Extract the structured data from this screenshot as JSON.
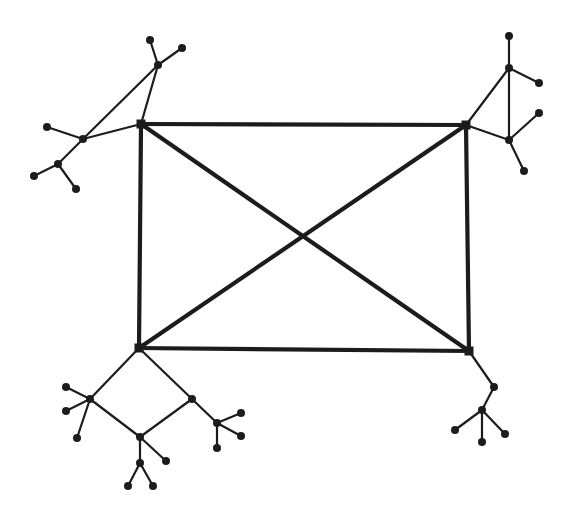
{
  "diagram": {
    "type": "graph",
    "colors": {
      "stroke": "#1c1c1c",
      "background": "#ffffff"
    },
    "core_nodes": [
      {
        "id": "TL",
        "x": 141,
        "y": 124
      },
      {
        "id": "TR",
        "x": 466,
        "y": 125
      },
      {
        "id": "BL",
        "x": 139,
        "y": 348
      },
      {
        "id": "BR",
        "x": 469,
        "y": 351
      }
    ],
    "core_edges": [
      [
        "TL",
        "TR"
      ],
      [
        "TR",
        "BR"
      ],
      [
        "BR",
        "BL"
      ],
      [
        "BL",
        "TL"
      ],
      [
        "TL",
        "BR"
      ],
      [
        "TR",
        "BL"
      ]
    ],
    "nodes": [
      {
        "id": "a1",
        "x": 150,
        "y": 40
      },
      {
        "id": "a2",
        "x": 182,
        "y": 48
      },
      {
        "id": "a3",
        "x": 158,
        "y": 65
      },
      {
        "id": "a4",
        "x": 83,
        "y": 139
      },
      {
        "id": "a5",
        "x": 47,
        "y": 127
      },
      {
        "id": "a6",
        "x": 58,
        "y": 164
      },
      {
        "id": "a7",
        "x": 34,
        "y": 176
      },
      {
        "id": "a8",
        "x": 76,
        "y": 189
      },
      {
        "id": "b1",
        "x": 509,
        "y": 36
      },
      {
        "id": "b2",
        "x": 509,
        "y": 68
      },
      {
        "id": "b3",
        "x": 539,
        "y": 83
      },
      {
        "id": "b4",
        "x": 509,
        "y": 140
      },
      {
        "id": "b5",
        "x": 539,
        "y": 113
      },
      {
        "id": "b6",
        "x": 524,
        "y": 171
      },
      {
        "id": "c1",
        "x": 90,
        "y": 399
      },
      {
        "id": "c2",
        "x": 66,
        "y": 387
      },
      {
        "id": "c3",
        "x": 66,
        "y": 411
      },
      {
        "id": "c4",
        "x": 77,
        "y": 438
      },
      {
        "id": "c5",
        "x": 192,
        "y": 399
      },
      {
        "id": "c6",
        "x": 140,
        "y": 437
      },
      {
        "id": "c7",
        "x": 217,
        "y": 423
      },
      {
        "id": "c8",
        "x": 241,
        "y": 413
      },
      {
        "id": "c9",
        "x": 241,
        "y": 436
      },
      {
        "id": "c10",
        "x": 217,
        "y": 448
      },
      {
        "id": "c11",
        "x": 166,
        "y": 461
      },
      {
        "id": "c12",
        "x": 140,
        "y": 463
      },
      {
        "id": "c13",
        "x": 128,
        "y": 486
      },
      {
        "id": "c14",
        "x": 153,
        "y": 486
      },
      {
        "id": "d1",
        "x": 494,
        "y": 387
      },
      {
        "id": "d2",
        "x": 482,
        "y": 410
      },
      {
        "id": "d3",
        "x": 455,
        "y": 430
      },
      {
        "id": "d4",
        "x": 482,
        "y": 442
      },
      {
        "id": "d5",
        "x": 505,
        "y": 434
      }
    ],
    "edges": [
      [
        "TL",
        "a3"
      ],
      [
        "TL",
        "a4"
      ],
      [
        "a3",
        "a4"
      ],
      [
        "a3",
        "a1"
      ],
      [
        "a3",
        "a2"
      ],
      [
        "a4",
        "a5"
      ],
      [
        "a4",
        "a6"
      ],
      [
        "a6",
        "a7"
      ],
      [
        "a6",
        "a8"
      ],
      [
        "TR",
        "b2"
      ],
      [
        "TR",
        "b4"
      ],
      [
        "b2",
        "b4"
      ],
      [
        "b2",
        "b1"
      ],
      [
        "b2",
        "b3"
      ],
      [
        "b4",
        "b5"
      ],
      [
        "b4",
        "b6"
      ],
      [
        "BL",
        "c1"
      ],
      [
        "BL",
        "c5"
      ],
      [
        "c1",
        "c6"
      ],
      [
        "c5",
        "c6"
      ],
      [
        "c1",
        "c2"
      ],
      [
        "c1",
        "c3"
      ],
      [
        "c1",
        "c4"
      ],
      [
        "c5",
        "c7"
      ],
      [
        "c7",
        "c8"
      ],
      [
        "c7",
        "c9"
      ],
      [
        "c7",
        "c10"
      ],
      [
        "c6",
        "c11"
      ],
      [
        "c6",
        "c12"
      ],
      [
        "c12",
        "c13"
      ],
      [
        "c12",
        "c14"
      ],
      [
        "BR",
        "d1"
      ],
      [
        "d1",
        "d2"
      ],
      [
        "d2",
        "d3"
      ],
      [
        "d2",
        "d4"
      ],
      [
        "d2",
        "d5"
      ]
    ]
  }
}
